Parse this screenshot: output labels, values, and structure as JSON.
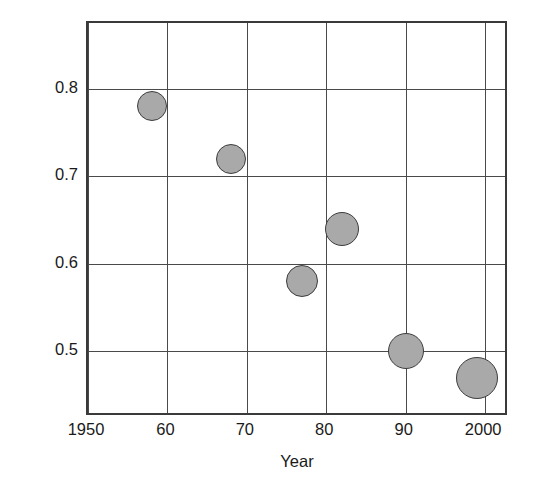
{
  "chart_data": {
    "type": "scatter",
    "title": "",
    "xlabel": "Year",
    "ylabel": "Specific fuel consumption (sfc)  lb/SHP hr",
    "xlim": [
      1950,
      2003
    ],
    "ylim": [
      0.425,
      0.875
    ],
    "grid": true,
    "legend_position": "none",
    "x_tick_values": [
      1950,
      1960,
      1970,
      1980,
      1990,
      2000
    ],
    "x_tick_labels": [
      "1950",
      "60",
      "70",
      "80",
      "90",
      "2000"
    ],
    "y_tick_values": [
      0.8,
      0.7,
      0.6,
      0.5
    ],
    "y_tick_labels": [
      "0.8",
      "0.7",
      "0.6",
      "0.5"
    ],
    "marker_fill": "#a9a9a9",
    "marker_edge": "#3d3d3d",
    "axis_color": "#3a3a3a",
    "points": [
      {
        "x": 1958,
        "y": 0.78,
        "size": 30
      },
      {
        "x": 1968,
        "y": 0.72,
        "size": 30
      },
      {
        "x": 1977,
        "y": 0.58,
        "size": 32
      },
      {
        "x": 1982,
        "y": 0.64,
        "size": 34
      },
      {
        "x": 1990,
        "y": 0.5,
        "size": 36
      },
      {
        "x": 1999,
        "y": 0.47,
        "size": 42
      }
    ]
  }
}
